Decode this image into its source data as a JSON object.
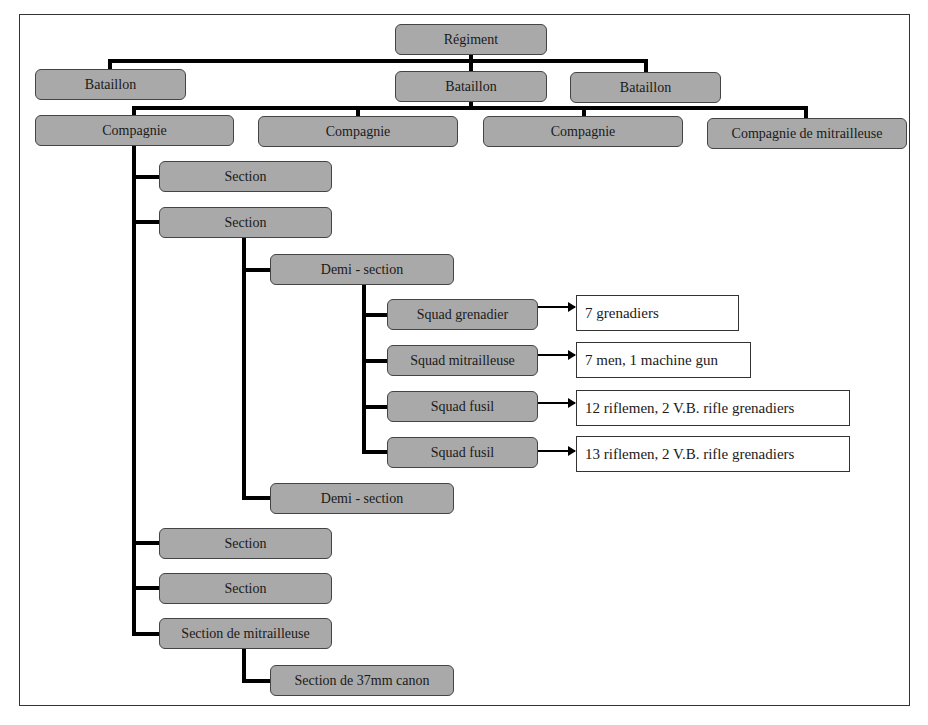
{
  "diagram": {
    "regiment": "Régiment",
    "battalions": [
      "Bataillon",
      "Bataillon",
      "Bataillon"
    ],
    "companies": [
      "Compagnie",
      "Compagnie",
      "Compagnie",
      "Compagnie de mitrailleuse"
    ],
    "sections": [
      "Section",
      "Section",
      "Section",
      "Section",
      "Section de mitrailleuse"
    ],
    "demi_sections": [
      "Demi - section",
      "Demi - section"
    ],
    "squads": [
      "Squad grenadier",
      "Squad mitrailleuse",
      "Squad fusil",
      "Squad fusil"
    ],
    "squad_notes": [
      "7 grenadiers",
      "7 men, 1 machine gun",
      "12 riflemen, 2 V.B. rifle grenadiers",
      "13 riflemen, 2 V.B. rifle grenadiers"
    ],
    "sub_section": "Section de 37mm canon"
  }
}
